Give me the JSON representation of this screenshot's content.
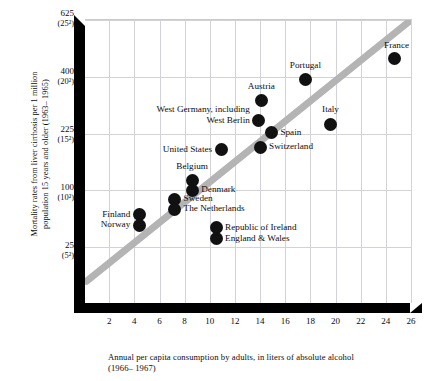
{
  "chart_data": {
    "type": "scatter",
    "title": "",
    "xlabel": "Annual per capita consumption by adults, in liters of absolute alcohol (1966– 1967)",
    "ylabel": "Mortality rates from liver cirrhosis per 1 million population 15 years and older (1963– 1965)",
    "x_caption_line1": "Annual per capita consumption by adults, in liters of absolute alcohol",
    "x_caption_line2": "(1966– 1967)",
    "y_caption_line1": "Mortality rates from liver cirrhosis per 1 million",
    "y_caption_line2": "population 15 years and older (1963– 1965)",
    "y_scale": "square-root",
    "xlim": [
      0,
      26
    ],
    "ylim": [
      0,
      625
    ],
    "grid": true,
    "legend": "none",
    "xticks": [
      2,
      4,
      6,
      8,
      10,
      12,
      14,
      16,
      18,
      20,
      22,
      24,
      26
    ],
    "yticks": [
      {
        "value": 625,
        "label": "625",
        "sublabel": "(25²)"
      },
      {
        "value": 400,
        "label": "400",
        "sublabel": "(20²)"
      },
      {
        "value": 225,
        "label": "225",
        "sublabel": "(15²)"
      },
      {
        "value": 100,
        "label": "100",
        "sublabel": "(10²)"
      },
      {
        "value": 25,
        "label": "25",
        "sublabel": "(5²)"
      }
    ],
    "trendline": {
      "type": "band",
      "color": "#b4b4b4",
      "from_x": 0.2,
      "from_y": 4,
      "to_x": 26,
      "to_y": 625
    },
    "point_color": "#111111",
    "points": [
      {
        "name": "France",
        "x": 24.7,
        "y": 466,
        "label": "France",
        "label_pos": "above-left"
      },
      {
        "name": "Portugal",
        "x": 17.6,
        "y": 390,
        "label": "Portugal",
        "label_pos": "above"
      },
      {
        "name": "Austria",
        "x": 14.1,
        "y": 320,
        "label": "Austria",
        "label_pos": "above"
      },
      {
        "name": "Italy",
        "x": 19.6,
        "y": 250,
        "label": "Italy",
        "label_pos": "above"
      },
      {
        "name": "West Germany, including West Berlin",
        "x": 13.9,
        "y": 262,
        "label": "West Germany, including\nWest Berlin",
        "label_pos": "left"
      },
      {
        "name": "Spain",
        "x": 14.9,
        "y": 228,
        "label": "Spain",
        "label_pos": "right"
      },
      {
        "name": "Switzerland",
        "x": 14.0,
        "y": 190,
        "label": "Switzerland",
        "label_pos": "right"
      },
      {
        "name": "United States",
        "x": 10.9,
        "y": 185,
        "label": "United States",
        "label_pos": "left"
      },
      {
        "name": "Belgium",
        "x": 8.6,
        "y": 118,
        "label": "Belgium",
        "label_pos": "above"
      },
      {
        "name": "Denmark",
        "x": 8.6,
        "y": 100,
        "label": "Denmark",
        "label_pos": "right"
      },
      {
        "name": "Sweden",
        "x": 7.2,
        "y": 85,
        "label": "Sweden",
        "label_pos": "right"
      },
      {
        "name": "The Netherlands",
        "x": 7.2,
        "y": 70,
        "label": "The Netherlands",
        "label_pos": "right"
      },
      {
        "name": "Finland",
        "x": 4.4,
        "y": 62,
        "label": "Finland",
        "label_pos": "left"
      },
      {
        "name": "Norway",
        "x": 4.4,
        "y": 48,
        "label": "Norway",
        "label_pos": "left"
      },
      {
        "name": "Republic of Ireland",
        "x": 10.5,
        "y": 45,
        "label": "Republic of Ireland",
        "label_pos": "right"
      },
      {
        "name": "England & Wales",
        "x": 10.5,
        "y": 33,
        "label": "England & Wales",
        "label_pos": "right"
      }
    ]
  }
}
